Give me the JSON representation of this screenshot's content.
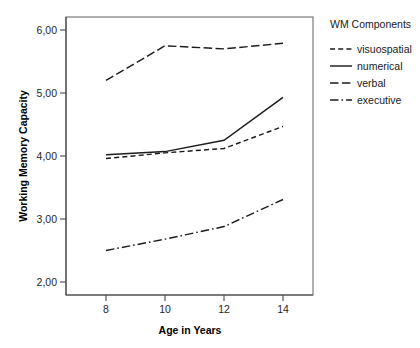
{
  "chart_data": {
    "type": "line",
    "title": "",
    "xlabel": "Age in Years",
    "ylabel": "Working Memory Capacity",
    "x": [
      8,
      10,
      12,
      14
    ],
    "xtick_labels": [
      "8",
      "10",
      "12",
      "14"
    ],
    "ytick_values": [
      2.0,
      3.0,
      4.0,
      5.0,
      6.0
    ],
    "ytick_labels": [
      "2,00",
      "3,00",
      "4,00",
      "5,00",
      "6,00"
    ],
    "xlim": [
      7.0,
      15.0
    ],
    "ylim": [
      1.8,
      6.2
    ],
    "grid": false,
    "legend_position": "right",
    "legend_title": "WM Components",
    "series": [
      {
        "name": "visuospatial",
        "line_style": "dashed",
        "color": "#1c1c1c",
        "values": [
          3.96,
          4.05,
          4.12,
          4.47
        ]
      },
      {
        "name": "numerical",
        "line_style": "solid",
        "color": "#1c1c1c",
        "values": [
          4.02,
          4.07,
          4.25,
          4.93
        ]
      },
      {
        "name": "verbal",
        "line_style": "long-dashed",
        "color": "#1c1c1c",
        "values": [
          5.2,
          5.75,
          5.7,
          5.79
        ]
      },
      {
        "name": "executive",
        "line_style": "dash-dot",
        "color": "#1c1c1c",
        "values": [
          2.5,
          2.68,
          2.88,
          3.31
        ]
      }
    ]
  },
  "legend": {
    "title": "WM Components",
    "items": [
      {
        "label": "visuospatial",
        "style": "visuospatial"
      },
      {
        "label": "numerical",
        "style": "numerical"
      },
      {
        "label": "verbal",
        "style": "verbal"
      },
      {
        "label": "executive",
        "style": "executive"
      }
    ]
  },
  "axes": {
    "x_title": "Age in Years",
    "y_title": "Working Memory Capacity"
  }
}
